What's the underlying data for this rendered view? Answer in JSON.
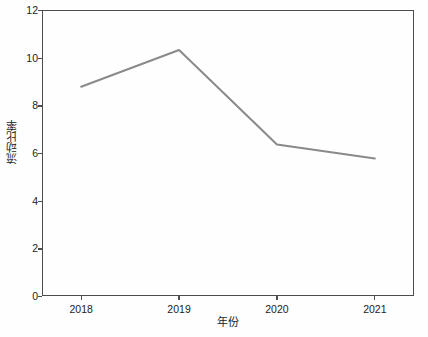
{
  "chart_data": {
    "type": "line",
    "title": "",
    "xlabel": "年份",
    "ylabel": "流动比率",
    "categories": [
      "2018",
      "2019",
      "2020",
      "2021"
    ],
    "values": [
      8.78,
      10.32,
      6.36,
      5.77
    ],
    "series": [
      {
        "name": "流动比率",
        "values": [
          8.78,
          10.32,
          6.36,
          5.77
        ],
        "color": "#8a8a8a"
      }
    ],
    "xlim": [
      2017.6,
      2021.4
    ],
    "ylim": [
      0,
      12
    ],
    "yticks": [
      0,
      2,
      4,
      6,
      8,
      10,
      12
    ],
    "ytick_labels": [
      "0",
      "2",
      "4",
      "6",
      "8",
      "10",
      "12"
    ],
    "xticks": [
      2018,
      2019,
      2020,
      2021
    ],
    "xtick_labels": [
      "2018",
      "2019",
      "2020",
      "2021"
    ],
    "grid": false,
    "legend": false,
    "legend_position": "none",
    "marker": "none",
    "line_width": 2,
    "frame": true
  },
  "style": {
    "background": "#fefefe",
    "axis_color": "#4d4d4d",
    "text_color": "#1c1c1c",
    "line_color": "#8a8a8a"
  }
}
